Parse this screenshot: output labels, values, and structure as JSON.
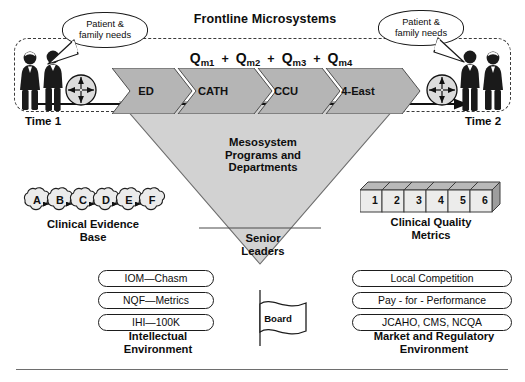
{
  "diagram": {
    "title": "Frontline Microsystems",
    "time_start_label": "Time 1",
    "time_end_label": "Time 2",
    "bubble_left_text": "Patient &\nfamily needs",
    "bubble_right_text": "Patient &\nfamily needs"
  },
  "formula": {
    "terms": [
      {
        "base": "Q",
        "sub": "m1"
      },
      {
        "base": "Q",
        "sub": "m2"
      },
      {
        "base": "Q",
        "sub": "m3"
      },
      {
        "base": "Q",
        "sub": "m4"
      }
    ],
    "operator": "+"
  },
  "chevrons": [
    {
      "label": "ED"
    },
    {
      "label": "CATH"
    },
    {
      "label": "CCU"
    },
    {
      "label": "4-East"
    }
  ],
  "funnel": {
    "mesosystem_label": "Mesosystem\nPrograms and\nDepartments",
    "senior_leaders_label": "Senior\nLeaders",
    "board_label": "Board"
  },
  "evidence": {
    "cloud_letters": [
      "A",
      "B",
      "C",
      "D",
      "E",
      "F"
    ],
    "caption": "Clinical Evidence\nBase"
  },
  "metrics": {
    "block_numbers": [
      "1",
      "2",
      "3",
      "4",
      "5",
      "6"
    ],
    "caption": "Clinical Quality\nMetrics"
  },
  "intellectual_environment": {
    "items": [
      "IOM—Chasm",
      "NQF—Metrics",
      "IHI—100K"
    ],
    "caption": "Intellectual\nEnvironment"
  },
  "market_environment": {
    "items": [
      "Local Competition",
      "Pay - for - Performance",
      "JCAHO, CMS, NCQA"
    ],
    "caption": "Market and Regulatory\nEnvironment"
  },
  "colors": {
    "chevron_fill": "#b5b5b5",
    "funnel_fill": "#d2d2d2",
    "block_face": "#ececeb",
    "block_top": "#b9b9b9",
    "outline": "#1d1d1d",
    "dashed_border": "#3b3b3b"
  }
}
